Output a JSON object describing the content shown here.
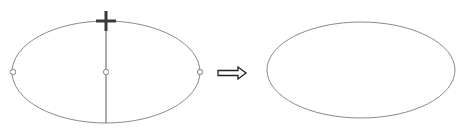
{
  "diagram": {
    "colors": {
      "stroke": "#8a8a8a",
      "axis": "#7a7a7a",
      "cursor": "#3a3a3a",
      "arrow": "#222222",
      "background": "#ffffff"
    },
    "before": {
      "ellipse": {
        "cx": 106,
        "cy": 72,
        "rx": 94,
        "ry": 51
      },
      "axis": {
        "x": 106,
        "y1": 21,
        "y2": 123
      },
      "handles": [
        {
          "name": "left-handle",
          "x": 13,
          "y": 72
        },
        {
          "name": "center-handle",
          "x": 106,
          "y": 72
        },
        {
          "name": "right-handle",
          "x": 200,
          "y": 72
        }
      ],
      "cursor": {
        "type": "move-cross",
        "x": 106,
        "y": 21
      }
    },
    "arrow": {
      "x1": 218,
      "x2": 246,
      "y": 73,
      "symbol": "⇨"
    },
    "after": {
      "ellipse": {
        "cx": 361,
        "cy": 70,
        "rx": 94,
        "ry": 48
      }
    }
  }
}
